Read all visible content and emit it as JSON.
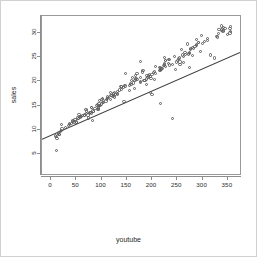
{
  "chart_data": {
    "type": "scatter",
    "title": "",
    "xlabel": "youtube",
    "ylabel": "sales",
    "xlim": [
      -18,
      378
    ],
    "ylim": [
      0.5,
      33.5
    ],
    "xticks": [
      0,
      50,
      100,
      150,
      200,
      250,
      300,
      350
    ],
    "yticks": [
      5,
      10,
      15,
      20,
      25,
      30
    ],
    "grid": false,
    "legend": null,
    "marker": "open-circle",
    "marker_color": "#5b5b5b",
    "line_color": "#3c3c3c",
    "background": "#ffffff",
    "frame_color": "#9a9a9a",
    "border_color": "#d2d2d2",
    "fit_line": {
      "type": "linear-regression",
      "x_endpoints": [
        -18,
        378
      ],
      "y_endpoints": [
        7.75,
        25.9
      ]
    },
    "series": [
      {
        "name": "sales vs youtube",
        "x": [
          276.12,
          53.4,
          20.64,
          181.8,
          216.96,
          10.44,
          69,
          144.24,
          10.32,
          239.76,
          79.32,
          257.64,
          28.64,
          117.0,
          244.92,
          234.48,
          81.36,
          337.68,
          83.04,
          176.76,
          262.08,
          284.88,
          15.84,
          273.96,
          74.76,
          315.48,
          171.48,
          288.12,
          298.08,
          199.8,
          188.76,
          50.04,
          225.24,
          54.12,
          204.12,
          147.96,
          93.6,
          324.24,
          204.84,
          288.0,
          11.52,
          17.4,
          269.88,
          91.68,
          332.64,
          170.28,
          276.36,
          165.24,
          123.12,
          159.48,
          79.8,
          98.52,
          138.84,
          79.32,
          43.56,
          35.04,
          155.76,
          304.44,
          272.64,
          94.92,
          96.6,
          255.12,
          246.0,
          146.04,
          94.32,
          167.16,
          197.4,
          296.16,
          206.76,
          227.16,
          101.28,
          15.36,
          120.72,
          354.12,
          349.44,
          138.36,
          100.92,
          279.48,
          255.24,
          93.0,
          309.72,
          45.48,
          55.08,
          329.88,
          177.12,
          131.52,
          193.32,
          83.76,
          21.0,
          274.08,
          72.96,
          112.08,
          86.76,
          89.64,
          132.12,
          112.32,
          176.52,
          336.96,
          214.2,
          102.36,
          232.92,
          60.84,
          265.56,
          148.08,
          194.4,
          232.8,
          113.04,
          62.4,
          224.52,
          109.2,
          226.8,
          78.72,
          70.2,
          168.48,
          166.2,
          36.0,
          77.16,
          341.4,
          273.96,
          226.2,
          280.68,
          265.08,
          218.04,
          223.2,
          118.44,
          291.6,
          124.2,
          176.76,
          331.44,
          104.4,
          125.04,
          166.8,
          224.52,
          57.12,
          340.32,
          220.44,
          43.2,
          355.8,
          215.16,
          252.84,
          157.08,
          248.76,
          50.4,
          262.2,
          131.52,
          122.64,
          291.96,
          135.72,
          39.84,
          8.4,
          196.56,
          143.88,
          161.88,
          180.36,
          354.6,
          37.2,
          21.6,
          47.16,
          158.4,
          217.2,
          253.92,
          199.68,
          127.68,
          69.96,
          203.52,
          282.24,
          93.36,
          197.88,
          189.96,
          234.12,
          139.2,
          191.88,
          76.8,
          340.56,
          287.28,
          19.2,
          327.84,
          126.0,
          260.28,
          57.72,
          240.0,
          66.48,
          163.08,
          117.12,
          99.36,
          186.12,
          66.72,
          216.0,
          216.36,
          108.72,
          188.4,
          310.2,
          250.56,
          300.0,
          154.8,
          344.4,
          207.12,
          96.12,
          354.24,
          183.96
        ],
        "y": [
          26.52,
          12.48,
          11.16,
          22.2,
          15.48,
          8.64,
          14.16,
          15.84,
          5.76,
          12.36,
          14.64,
          26.64,
          10.56,
          17.64,
          25.2,
          24.48,
          12.0,
          31.44,
          13.92,
          24.12,
          23.88,
          27.24,
          9.12,
          22.8,
          12.48,
          25.44,
          20.4,
          28.68,
          29.52,
          17.28,
          19.44,
          11.52,
          24.96,
          12.36,
          20.4,
          21.6,
          14.52,
          24.84,
          22.08,
          27.36,
          8.28,
          9.12,
          27.72,
          15.24,
          30.72,
          21.72,
          26.88,
          18.6,
          17.52,
          20.16,
          13.44,
          15.12,
          18.84,
          14.64,
          11.88,
          10.92,
          18.12,
          28.32,
          25.68,
          15.36,
          16.08,
          23.52,
          22.44,
          19.2,
          14.16,
          21.24,
          17.64,
          26.16,
          23.04,
          24.24,
          16.44,
          9.36,
          17.04,
          30.0,
          29.76,
          18.96,
          16.2,
          25.32,
          24.0,
          14.28,
          28.92,
          11.52,
          13.2,
          29.16,
          19.8,
          17.28,
          21.12,
          13.8,
          9.96,
          25.8,
          13.08,
          16.8,
          14.4,
          15.0,
          17.88,
          16.56,
          20.88,
          30.6,
          22.32,
          15.6,
          23.76,
          12.72,
          25.56,
          19.08,
          21.36,
          24.6,
          16.68,
          12.96,
          23.4,
          16.32,
          24.36,
          13.56,
          13.32,
          20.64,
          20.28,
          11.04,
          13.68,
          31.2,
          26.04,
          23.16,
          27.0,
          25.92,
          22.56,
          23.28,
          17.16,
          27.96,
          17.4,
          19.92,
          29.88,
          15.72,
          17.76,
          20.52,
          23.64,
          12.6,
          30.36,
          22.68,
          11.76,
          31.32,
          22.92,
          24.72,
          19.56,
          24.0,
          11.64,
          25.08,
          17.52,
          16.92,
          28.08,
          18.24,
          11.28,
          8.76,
          21.0,
          18.72,
          20.76,
          21.96,
          30.24,
          11.4,
          10.2,
          12.12,
          19.32,
          22.8,
          24.84,
          21.48,
          17.28,
          13.92,
          21.84,
          26.76,
          14.76,
          20.64,
          21.24,
          23.4,
          18.36,
          20.88,
          13.32,
          30.48,
          27.6,
          9.6,
          29.28,
          16.8,
          25.44,
          12.84,
          23.52,
          13.08,
          19.68,
          16.2,
          15.36,
          20.16,
          12.96,
          22.2,
          22.44,
          15.96,
          20.52,
          28.44,
          24.36,
          27.84,
          19.2,
          30.84,
          21.6,
          15.12,
          30.96,
          20.28
        ]
      }
    ]
  }
}
